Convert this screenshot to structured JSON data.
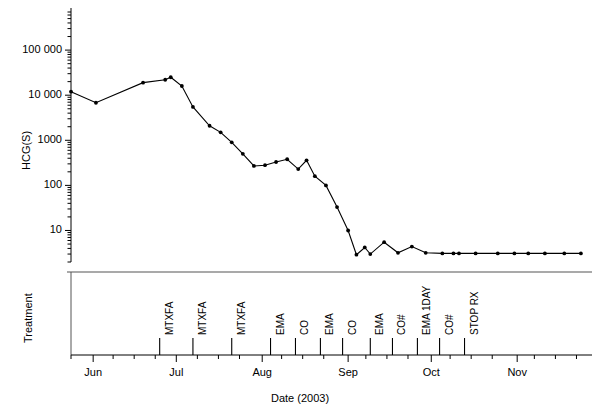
{
  "figure": {
    "type": "medical-marker-chart",
    "background": "#ffffff",
    "line_color": "#000000",
    "marker_color": "#000000"
  },
  "axes": {
    "y": {
      "label": "HCG(S)",
      "scale": "log",
      "ticks": [
        "10",
        "100",
        "1000",
        "10 000",
        "100 000"
      ],
      "tick_values": [
        10,
        100,
        1000,
        10000,
        100000
      ],
      "range": [
        2.0,
        700000
      ]
    },
    "x": {
      "label": "Date (2003)",
      "ticks": [
        "Jun",
        "Jul",
        "Aug",
        "Sep",
        "Oct",
        "Nov"
      ],
      "tick_days": [
        0,
        30,
        61,
        92,
        122,
        153
      ],
      "range_days": [
        -8,
        180
      ]
    }
  },
  "treatment_panel": {
    "label": "Treatment",
    "events": [
      {
        "label": "MTXFA",
        "day": 24
      },
      {
        "label": "MTXFA",
        "day": 36
      },
      {
        "label": "MTXFA",
        "day": 50
      },
      {
        "label": "EMA",
        "day": 64
      },
      {
        "label": "CO",
        "day": 73
      },
      {
        "label": "EMA",
        "day": 82
      },
      {
        "label": "CO",
        "day": 90
      },
      {
        "label": "EMA",
        "day": 100
      },
      {
        "label": "CO#",
        "day": 108
      },
      {
        "label": "EMA 1DAY",
        "day": 117
      },
      {
        "label": "CO#",
        "day": 125
      },
      {
        "label": "STOP RX",
        "day": 134
      }
    ]
  },
  "chart_data": {
    "type": "line",
    "title": "",
    "xlabel": "Date (2003)",
    "ylabel": "HCG(S)",
    "yscale": "log",
    "ylim": [
      2.0,
      700000
    ],
    "xlim_days": [
      -8,
      180
    ],
    "x_tick_labels": [
      "Jun",
      "Jul",
      "Aug",
      "Sep",
      "Oct",
      "Nov"
    ],
    "x_tick_days": [
      0,
      30,
      61,
      92,
      122,
      153
    ],
    "y_tick_labels": [
      "10",
      "100",
      "1000",
      "10 000",
      "100 000"
    ],
    "y_tick_values": [
      10,
      100,
      1000,
      10000,
      100000
    ],
    "grid": false,
    "legend": null,
    "series": [
      {
        "name": "HCG(S)",
        "marker": "filled-circle",
        "points": [
          {
            "day": -8,
            "value": 12000
          },
          {
            "day": 1,
            "value": 6800
          },
          {
            "day": 18,
            "value": 19000
          },
          {
            "day": 26,
            "value": 22000
          },
          {
            "day": 28,
            "value": 25000
          },
          {
            "day": 32,
            "value": 16000
          },
          {
            "day": 36,
            "value": 5500
          },
          {
            "day": 42,
            "value": 2100
          },
          {
            "day": 46,
            "value": 1500
          },
          {
            "day": 50,
            "value": 900
          },
          {
            "day": 54,
            "value": 500
          },
          {
            "day": 58,
            "value": 270
          },
          {
            "day": 62,
            "value": 280
          },
          {
            "day": 66,
            "value": 330
          },
          {
            "day": 70,
            "value": 380
          },
          {
            "day": 74,
            "value": 230
          },
          {
            "day": 77,
            "value": 360
          },
          {
            "day": 80,
            "value": 160
          },
          {
            "day": 84,
            "value": 100
          },
          {
            "day": 88,
            "value": 33
          },
          {
            "day": 92,
            "value": 10
          },
          {
            "day": 95,
            "value": 2.9
          },
          {
            "day": 98,
            "value": 4.2
          },
          {
            "day": 100,
            "value": 3.0
          },
          {
            "day": 105,
            "value": 5.5
          },
          {
            "day": 110,
            "value": 3.2
          },
          {
            "day": 115,
            "value": 4.4
          },
          {
            "day": 120,
            "value": 3.2
          },
          {
            "day": 126,
            "value": 3.1
          },
          {
            "day": 130,
            "value": 3.1
          },
          {
            "day": 132,
            "value": 3.1
          },
          {
            "day": 138,
            "value": 3.1
          },
          {
            "day": 146,
            "value": 3.1
          },
          {
            "day": 152,
            "value": 3.1
          },
          {
            "day": 157,
            "value": 3.1
          },
          {
            "day": 163,
            "value": 3.1
          },
          {
            "day": 170,
            "value": 3.1
          },
          {
            "day": 176,
            "value": 3.1
          }
        ]
      }
    ]
  }
}
